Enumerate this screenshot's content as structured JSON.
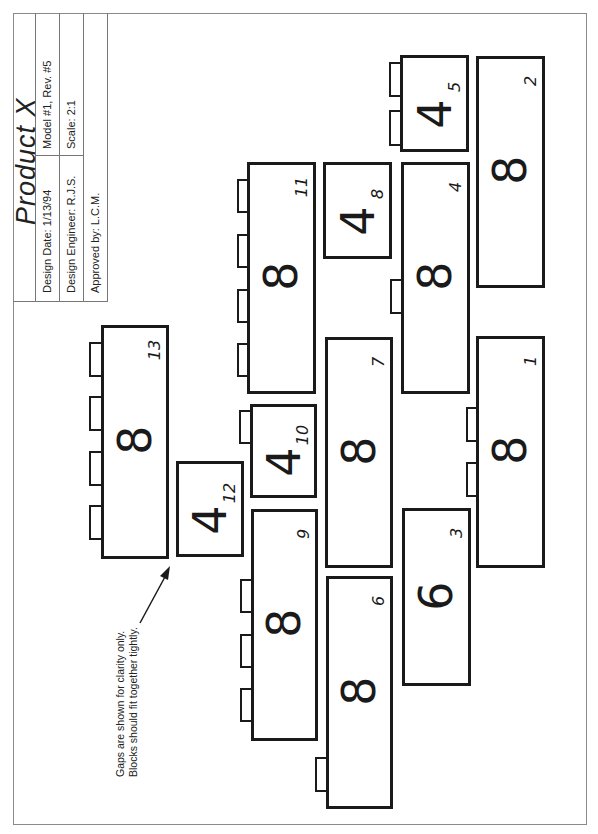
{
  "title_block": {
    "product": "Product  X",
    "design_date": "Design Date:  1/13/94",
    "model": "Model #1, Rev. #5",
    "design_engineer": "Design Engineer:  R.J.S.",
    "scale": "Scale: 2:1",
    "approved_by": "Approved by:  L.C.M."
  },
  "note": {
    "line1": "Gaps are shown for clarity only.",
    "line2": "Blocks should fit together tightly."
  },
  "blocks": [
    {
      "id": "13",
      "size": "8",
      "x": 101,
      "y": 325,
      "w": 68,
      "h": 234,
      "studs": [
        [
          89,
          342,
          13,
          35
        ],
        [
          89,
          396,
          13,
          35
        ],
        [
          89,
          451,
          13,
          35
        ],
        [
          89,
          505,
          13,
          35
        ]
      ]
    },
    {
      "id": "12",
      "size": "4",
      "x": 176,
      "y": 461,
      "w": 68,
      "h": 96,
      "studs": []
    },
    {
      "id": "11",
      "size": "8",
      "x": 247,
      "y": 162,
      "w": 69,
      "h": 232,
      "studs": [
        [
          237,
          179,
          12,
          34
        ],
        [
          237,
          234,
          12,
          34
        ],
        [
          237,
          289,
          12,
          34
        ],
        [
          237,
          343,
          12,
          34
        ]
      ]
    },
    {
      "id": "10",
      "size": "4",
      "x": 250,
      "y": 404,
      "w": 67,
      "h": 94,
      "studs": [
        [
          239,
          410,
          12,
          34
        ]
      ]
    },
    {
      "id": "9",
      "size": "8",
      "x": 251,
      "y": 509,
      "w": 67,
      "h": 232,
      "studs": [
        [
          240,
          579,
          12,
          34
        ],
        [
          240,
          634,
          12,
          34
        ],
        [
          240,
          688,
          12,
          34
        ]
      ]
    },
    {
      "id": "8",
      "size": "4",
      "x": 323,
      "y": 162,
      "w": 69,
      "h": 97,
      "studs": []
    },
    {
      "id": "7",
      "size": "8",
      "x": 325,
      "y": 337,
      "w": 68,
      "h": 231,
      "studs": []
    },
    {
      "id": "6",
      "size": "8",
      "x": 326,
      "y": 576,
      "w": 67,
      "h": 233,
      "studs": [
        [
          315,
          757,
          12,
          35
        ]
      ]
    },
    {
      "id": "5",
      "size": "4",
      "x": 400,
      "y": 55,
      "w": 69,
      "h": 97,
      "studs": [
        [
          389,
          62,
          12,
          35
        ],
        [
          389,
          110,
          12,
          36
        ]
      ]
    },
    {
      "id": "4",
      "size": "8",
      "x": 401,
      "y": 162,
      "w": 69,
      "h": 232,
      "studs": [
        [
          390,
          279,
          12,
          35
        ]
      ]
    },
    {
      "id": "3",
      "size": "6",
      "x": 402,
      "y": 508,
      "w": 69,
      "h": 178,
      "studs": []
    },
    {
      "id": "2",
      "size": "8",
      "x": 476,
      "y": 56,
      "w": 69,
      "h": 232,
      "studs": []
    },
    {
      "id": "1",
      "size": "8",
      "x": 476,
      "y": 336,
      "w": 69,
      "h": 232,
      "studs": [
        [
          466,
          407,
          11,
          35
        ],
        [
          466,
          462,
          11,
          35
        ]
      ]
    }
  ]
}
